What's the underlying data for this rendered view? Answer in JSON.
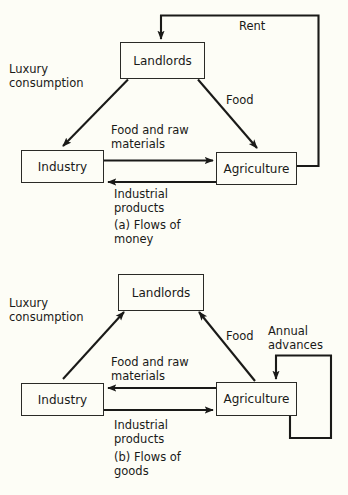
{
  "figure": {
    "background_color": "#fdfdf6",
    "line_color": "#1a1a18",
    "box_fill": "#fdfdf6"
  },
  "diagram_a": {
    "caption": "(a) Flows of\nmoney",
    "caption_line1": "(a) Flows of",
    "caption_line2": "money",
    "nodes": [
      {
        "id": "landlords",
        "label": "Landlords"
      },
      {
        "id": "industry",
        "label": "Industry"
      },
      {
        "id": "agriculture",
        "label": "Agriculture"
      }
    ],
    "edge_labels": {
      "rent": "Rent",
      "luxury_consumption_line1": "Luxury",
      "luxury_consumption_line2": "consumption",
      "food": "Food",
      "food_and_raw_line1": "Food and raw",
      "food_and_raw_line2": "materials",
      "industrial_products_line1": "Industrial",
      "industrial_products_line2": "products"
    },
    "flows": [
      {
        "from": "Agriculture",
        "to": "Landlords",
        "label": "Rent"
      },
      {
        "from": "Landlords",
        "to": "Industry",
        "label": "Luxury consumption"
      },
      {
        "from": "Landlords",
        "to": "Agriculture",
        "label": "Food"
      },
      {
        "from": "Industry",
        "to": "Agriculture",
        "label": "Food and raw materials"
      },
      {
        "from": "Agriculture",
        "to": "Industry",
        "label": "Industrial products"
      }
    ]
  },
  "diagram_b": {
    "caption": "(b) Flows of\ngoods",
    "caption_line1": "(b) Flows of",
    "caption_line2": "goods",
    "nodes": [
      {
        "id": "landlords",
        "label": "Landlords"
      },
      {
        "id": "industry",
        "label": "Industry"
      },
      {
        "id": "agriculture",
        "label": "Agriculture"
      }
    ],
    "edge_labels": {
      "luxury_consumption_line1": "Luxury",
      "luxury_consumption_line2": "consumption",
      "food": "Food",
      "annual_advances_line1": "Annual",
      "annual_advances_line2": "advances",
      "food_and_raw_line1": "Food and raw",
      "food_and_raw_line2": "materials",
      "industrial_products_line1": "Industrial",
      "industrial_products_line2": "products"
    },
    "flows": [
      {
        "from": "Industry",
        "to": "Landlords",
        "label": "Luxury consumption"
      },
      {
        "from": "Agriculture",
        "to": "Landlords",
        "label": "Food"
      },
      {
        "from": "Agriculture",
        "to": "Agriculture",
        "label": "Annual advances"
      },
      {
        "from": "Agriculture",
        "to": "Industry",
        "label": "Food and raw materials"
      },
      {
        "from": "Industry",
        "to": "Agriculture",
        "label": "Industrial products"
      }
    ]
  },
  "top_cut_text": ""
}
